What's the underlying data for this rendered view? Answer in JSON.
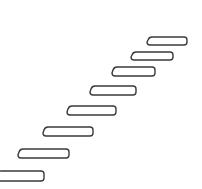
{
  "illustration": {
    "subject": "staircase",
    "stroke_color": "#3a3a3a",
    "fill_color": "#ffffff",
    "background": "#ffffff",
    "steps": [
      {
        "x": 147,
        "y": 37,
        "w": 40,
        "h": 8
      },
      {
        "x": 131,
        "y": 52,
        "w": 42,
        "h": 8
      },
      {
        "x": 112,
        "y": 67,
        "w": 43,
        "h": 9
      },
      {
        "x": 90,
        "y": 86,
        "w": 46,
        "h": 9
      },
      {
        "x": 67,
        "y": 106,
        "w": 49,
        "h": 9
      },
      {
        "x": 43,
        "y": 127,
        "w": 50,
        "h": 9
      },
      {
        "x": 18,
        "y": 149,
        "w": 51,
        "h": 9
      },
      {
        "x": -4,
        "y": 171,
        "w": 48,
        "h": 10
      }
    ]
  }
}
